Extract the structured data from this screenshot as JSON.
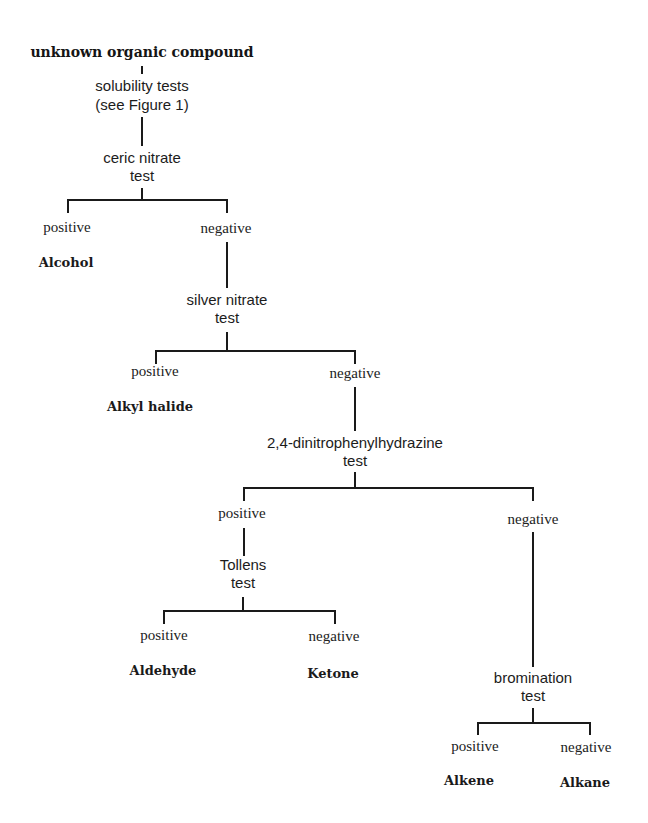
{
  "diagram": {
    "type": "decision-tree",
    "root": "unknown organic compound",
    "nodes": {
      "solubility": {
        "line1": "solubility tests",
        "line2": "(see Figure 1)"
      },
      "ceric": {
        "line1": "ceric nitrate",
        "line2": "test"
      },
      "silver": {
        "line1": "silver nitrate",
        "line2": "test"
      },
      "dnph": {
        "line1": "2,4-dinitrophenylhydrazine",
        "line2": "test"
      },
      "tollens": {
        "line1": "Tollens",
        "line2": "test"
      },
      "bromination": {
        "line1": "bromination",
        "line2": "test"
      }
    },
    "branches": {
      "positive": "positive",
      "negative": "negative"
    },
    "results": {
      "alcohol": "Alcohol",
      "alkyl_halide": "Alkyl halide",
      "aldehyde": "Aldehyde",
      "ketone": "Ketone",
      "alkene": "Alkene",
      "alkane": "Alkane"
    },
    "edges": [
      [
        "unknown organic compound",
        "solubility tests"
      ],
      [
        "solubility tests",
        "ceric nitrate test"
      ],
      [
        "ceric nitrate test",
        "positive",
        "Alcohol"
      ],
      [
        "ceric nitrate test",
        "negative",
        "silver nitrate test"
      ],
      [
        "silver nitrate test",
        "positive",
        "Alkyl halide"
      ],
      [
        "silver nitrate test",
        "negative",
        "2,4-dinitrophenylhydrazine test"
      ],
      [
        "2,4-dinitrophenylhydrazine test",
        "positive",
        "Tollens test"
      ],
      [
        "2,4-dinitrophenylhydrazine test",
        "negative",
        "bromination test"
      ],
      [
        "Tollens test",
        "positive",
        "Aldehyde"
      ],
      [
        "Tollens test",
        "negative",
        "Ketone"
      ],
      [
        "bromination test",
        "positive",
        "Alkene"
      ],
      [
        "bromination test",
        "negative",
        "Alkane"
      ]
    ]
  }
}
